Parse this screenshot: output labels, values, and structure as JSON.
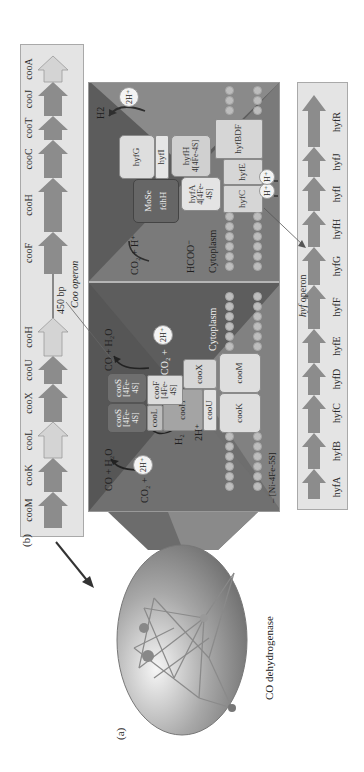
{
  "figure": {
    "panel_a_label": "(a)",
    "panel_b_label": "(b)",
    "enzyme_caption": "CO dehydrogenase"
  },
  "coo_operon": {
    "title": "Coo operon",
    "spacer_label": "450 bp",
    "genes": [
      {
        "name": "cooM",
        "shade": "dark"
      },
      {
        "name": "cooK",
        "shade": "dark"
      },
      {
        "name": "cooL",
        "shade": "light"
      },
      {
        "name": "cooX",
        "shade": "dark"
      },
      {
        "name": "cooU",
        "shade": "dark"
      },
      {
        "name": "cooH",
        "shade": "light"
      },
      {
        "name": "cooF",
        "shade": "dark"
      },
      {
        "name": "cooH",
        "shade": "dark"
      },
      {
        "name": "cooC",
        "shade": "dark"
      },
      {
        "name": "cooT",
        "shade": "dark"
      },
      {
        "name": "cooJ",
        "shade": "dark"
      },
      {
        "name": "cooA",
        "shade": "light"
      }
    ]
  },
  "hyf_operon": {
    "title_italic": "hyf",
    "title_rest": " operon",
    "genes": [
      "hyfA",
      "hyfB",
      "hyfC",
      "hyfD",
      "hyfE",
      "hyfF",
      "hyfG",
      "hyfH",
      "hyfI",
      "hyfJ",
      "hyfR"
    ]
  },
  "coo_complex": {
    "subunits": {
      "cooS_1": "cooS",
      "cooS_1_cluster": "[4Fe-4S]",
      "cooS_2": "cooS",
      "cooS_2_cluster": "[4Fe-4S]",
      "cooL": "cooL",
      "cooH": "cooH",
      "cooF": "cooF",
      "cooF_cluster": "[4Fe-4S]",
      "cooX": "cooX",
      "cooU": "cooU",
      "cooK": "cooK",
      "cooM": "cooM"
    },
    "reactions": {
      "left_substrate": "CO + H₂O",
      "left_product": "CO₂ +",
      "left_protons": "2H⁺",
      "right_substrate": "CO + H₂O",
      "right_product": "CO₂ +",
      "right_protons": "2H⁺",
      "h2": "H₂",
      "two_h": "2H⁺"
    },
    "cytoplasm_label": "Cytoplasm",
    "legend": "– [Ni-4Fe-5S]"
  },
  "hyf_complex": {
    "subunits": {
      "mose": "MoSe",
      "fdhH": "fdhH",
      "hyfG": "hyfG",
      "hyfI": "hyfI",
      "hyfH": "hyfH",
      "hyfH_cluster": "4[4Fe-4S]",
      "hyfA": "hyfA",
      "hyfA_cluster": "4[4Fe-4S]",
      "hyfBDF": "hyfBDF",
      "hyfE": "hyfE",
      "hyfC": "hyfC"
    },
    "reactions": {
      "h2": "H2",
      "two_h": "2H⁺",
      "co2_h": "CO₂ + H⁺",
      "hcoo": "HCOO⁻",
      "h_plus_1": "H⁺",
      "h_plus_2": "H⁺"
    },
    "cytoplasm_label": "Cytoplasm"
  },
  "colors": {
    "membrane_dark": "#5e5e5e",
    "membrane_mid": "#7b7b7b",
    "membrane_light": "#9a9a9a",
    "gene_dark": "#8c8c8c",
    "gene_light": "#d2d2d2",
    "panel_bg": "#e4e4e4",
    "subunit_light": "#dedede",
    "subunit_dark": "#6a6a6a"
  }
}
